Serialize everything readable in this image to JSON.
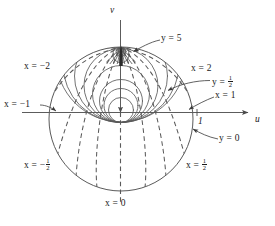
{
  "figure": {
    "type": "conformal-mapping-diagram",
    "axes": {
      "horizontal_label": "u",
      "vertical_label": "v",
      "tick_label_right": "1"
    },
    "geometry": {
      "unit_circle": {
        "center_u": 0,
        "center_v": 0,
        "radius": 1
      },
      "common_point": {
        "u": 0,
        "v": 1
      }
    },
    "labels": [
      {
        "id": "x-eq-minus-2",
        "text": "x = −2",
        "lead": false
      },
      {
        "id": "x-eq-minus-1",
        "text": "x = −1",
        "lead": true
      },
      {
        "id": "x-eq-minus-half",
        "text": "x = −½",
        "lead": false
      },
      {
        "id": "x-eq-0",
        "text": "x = 0",
        "lead": false
      },
      {
        "id": "x-eq-half",
        "text": "x = ½",
        "lead": false
      },
      {
        "id": "x-eq-1",
        "text": "x = 1",
        "lead": true
      },
      {
        "id": "x-eq-2",
        "text": "x = 2",
        "lead": false
      },
      {
        "id": "y-eq-0",
        "text": "y = 0",
        "lead": true
      },
      {
        "id": "y-eq-half",
        "text": "y = ½",
        "lead": true
      },
      {
        "id": "y-eq-5",
        "text": "y = 5",
        "lead": true
      }
    ],
    "label_text": {
      "x_minus_2": "x = −2",
      "x_minus_1": "x = −1",
      "x_minus_half_lead": "x = −",
      "x_0": "x = 0",
      "x_half_lead": "x = ",
      "x_1": "x = 1",
      "x_2": "x = 2",
      "y_0": "y = 0",
      "y_half_lead": "y = ",
      "y_5": "y = 5",
      "frac_num": "1",
      "frac_den": "2",
      "axis_u": "u",
      "axis_v": "v",
      "tick_one": "1"
    },
    "curve_families": {
      "x_const": {
        "style": "dashed",
        "values": [
          "0",
          "±½",
          "±1",
          "±2"
        ]
      },
      "y_const": {
        "style": "solid",
        "values": [
          "0",
          "½",
          "5"
        ]
      }
    },
    "colors": {
      "ink": "#1a1a1a",
      "curve": "#5a5a5a",
      "background": "#ffffff"
    }
  }
}
